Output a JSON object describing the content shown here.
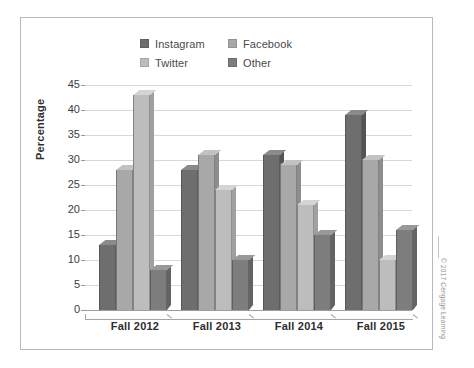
{
  "figure": {
    "copyright": "© 2017 Cengage Learning"
  },
  "chart_data": {
    "type": "bar",
    "title": "",
    "xlabel": "",
    "ylabel": "Percentage",
    "ylim": [
      0,
      45
    ],
    "ytick_step": 5,
    "yticks": [
      "45",
      "40",
      "35",
      "30",
      "25",
      "20",
      "15",
      "10",
      "5",
      "0"
    ],
    "grid": true,
    "legend_position": "top-center",
    "categories": [
      "Fall 2012",
      "Fall 2013",
      "Fall 2014",
      "Fall 2015"
    ],
    "series": [
      {
        "name": "Instagram",
        "color": "#6e6e6e",
        "top_color": "#8a8a8a",
        "side_color": "#545454",
        "values": [
          13,
          28,
          31,
          39
        ]
      },
      {
        "name": "Facebook",
        "color": "#a8a8a8",
        "top_color": "#c2c2c2",
        "side_color": "#8d8d8d",
        "values": [
          28,
          31,
          29,
          30
        ]
      },
      {
        "name": "Twitter",
        "color": "#bdbdbd",
        "top_color": "#d4d4d4",
        "side_color": "#a0a0a0",
        "values": [
          43,
          24,
          21,
          10
        ]
      },
      {
        "name": "Other",
        "color": "#7d7d7d",
        "top_color": "#989898",
        "side_color": "#636363",
        "values": [
          8,
          10,
          15,
          16
        ]
      }
    ]
  }
}
